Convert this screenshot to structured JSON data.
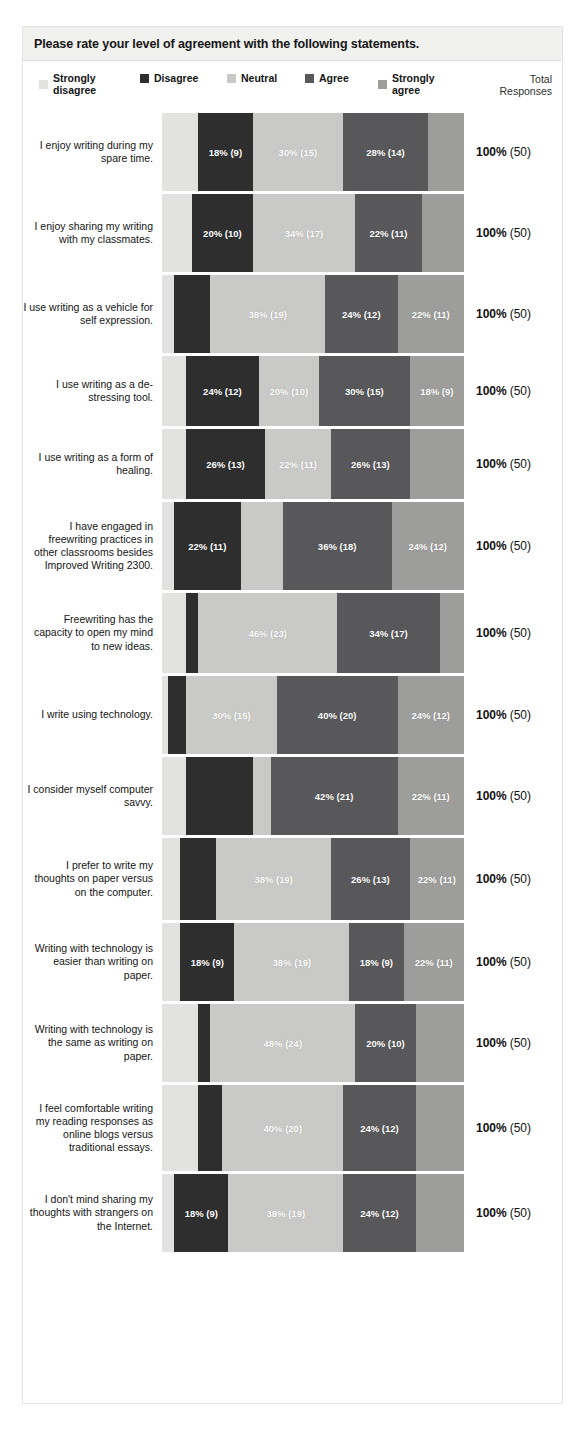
{
  "header": {
    "title": "Please rate your level of agreement with the following statements.",
    "total_header_line1": "Total",
    "total_header_line2": "Responses"
  },
  "legend": {
    "items": [
      {
        "label": "Strongly\ndisagree",
        "key": "strongly_disagree",
        "color": "#e2e2e0"
      },
      {
        "label": "Disagree",
        "key": "disagree",
        "color": "#2e2e2e"
      },
      {
        "label": "Neutral",
        "key": "neutral",
        "color": "#c9c9c7"
      },
      {
        "label": "Agree",
        "key": "agree",
        "color": "#58585a"
      },
      {
        "label": "Strongly\nagree",
        "key": "strongly_agree",
        "color": "#9d9d9b"
      }
    ]
  },
  "chart_data": {
    "type": "bar",
    "subtype": "stacked-horizontal-100pct",
    "title": "Please rate your level of agreement with the following statements.",
    "xlabel": "",
    "ylabel": "",
    "xlim": [
      0,
      100
    ],
    "grid": false,
    "legend_position": "top",
    "value_format": "percent (count)",
    "total_responses": 50,
    "categories": [
      "I enjoy writing during my spare time.",
      "I enjoy sharing my writing with my classmates.",
      "I use writing as a vehicle for self expression.",
      "I use writing as a de-stressing tool.",
      "I use writing as a form of healing.",
      "I have engaged in freewriting practices in other classrooms besides Improved Writing 2300.",
      "Freewriting has the capacity to open my mind to new ideas.",
      "I write using technology.",
      "I consider myself computer savvy.",
      "I prefer to write my thoughts on paper versus on the computer.",
      "Writing with technology is easier than writing on paper.",
      "Writing with technology is the same as writing on paper.",
      "I feel comfortable writing my reading responses as online blogs versus traditional essays.",
      "I don't mind sharing my thoughts with strangers on the Internet."
    ],
    "series": [
      {
        "name": "Strongly disagree",
        "values": [
          12,
          10,
          4,
          8,
          8,
          4,
          8,
          2,
          8,
          6,
          6,
          12,
          12,
          4
        ]
      },
      {
        "name": "Disagree",
        "values": [
          18,
          20,
          12,
          24,
          26,
          22,
          4,
          6,
          22,
          12,
          18,
          4,
          8,
          18
        ]
      },
      {
        "name": "Neutral",
        "values": [
          30,
          34,
          38,
          20,
          22,
          14,
          46,
          30,
          6,
          38,
          38,
          48,
          40,
          38
        ]
      },
      {
        "name": "Agree",
        "values": [
          28,
          22,
          24,
          30,
          26,
          36,
          34,
          40,
          42,
          26,
          18,
          20,
          24,
          24
        ]
      },
      {
        "name": "Strongly agree",
        "values": [
          12,
          14,
          22,
          18,
          18,
          24,
          8,
          22,
          22,
          18,
          20,
          16,
          16,
          16
        ]
      }
    ],
    "counts": [
      {
        "name": "Strongly disagree",
        "values": [
          6,
          5,
          2,
          4,
          4,
          2,
          4,
          1,
          4,
          3,
          3,
          6,
          6,
          2
        ]
      },
      {
        "name": "Disagree",
        "values": [
          9,
          10,
          6,
          12,
          13,
          11,
          2,
          3,
          11,
          6,
          9,
          2,
          4,
          9
        ]
      },
      {
        "name": "Neutral",
        "values": [
          15,
          17,
          19,
          10,
          11,
          7,
          23,
          15,
          3,
          19,
          19,
          24,
          20,
          19
        ]
      },
      {
        "name": "Agree",
        "values": [
          14,
          11,
          12,
          15,
          13,
          18,
          17,
          20,
          21,
          13,
          9,
          10,
          12,
          12
        ]
      },
      {
        "name": "Strongly agree",
        "values": [
          6,
          7,
          11,
          9,
          9,
          12,
          4,
          11,
          11,
          9,
          10,
          8,
          8,
          8
        ]
      }
    ]
  },
  "rows": [
    {
      "label": "I enjoy writing during my spare time.",
      "total": "100%",
      "total_count": "(50)",
      "segments": [
        {
          "key": "strongly_disagree",
          "pct": 12,
          "label": ""
        },
        {
          "key": "disagree",
          "pct": 18,
          "label": "18% (9)"
        },
        {
          "key": "neutral",
          "pct": 30,
          "label": "30% (15)"
        },
        {
          "key": "agree",
          "pct": 28,
          "label": "28% (14)"
        },
        {
          "key": "strongly_agree",
          "pct": 12,
          "label": ""
        }
      ]
    },
    {
      "label": "I enjoy sharing my writing with my classmates.",
      "total": "100%",
      "total_count": "(50)",
      "segments": [
        {
          "key": "strongly_disagree",
          "pct": 10,
          "label": ""
        },
        {
          "key": "disagree",
          "pct": 20,
          "label": "20% (10)"
        },
        {
          "key": "neutral",
          "pct": 34,
          "label": "34% (17)"
        },
        {
          "key": "agree",
          "pct": 22,
          "label": "22% (11)"
        },
        {
          "key": "strongly_agree",
          "pct": 14,
          "label": ""
        }
      ]
    },
    {
      "label": "I use writing as a vehicle for self expression.",
      "total": "100%",
      "total_count": "(50)",
      "segments": [
        {
          "key": "strongly_disagree",
          "pct": 4,
          "label": ""
        },
        {
          "key": "disagree",
          "pct": 12,
          "label": ""
        },
        {
          "key": "neutral",
          "pct": 38,
          "label": "38% (19)"
        },
        {
          "key": "agree",
          "pct": 24,
          "label": "24% (12)"
        },
        {
          "key": "strongly_agree",
          "pct": 22,
          "label": "22% (11)"
        }
      ]
    },
    {
      "label": "I use writing as a de-stressing tool.",
      "total": "100%",
      "total_count": "(50)",
      "segments": [
        {
          "key": "strongly_disagree",
          "pct": 8,
          "label": ""
        },
        {
          "key": "disagree",
          "pct": 24,
          "label": "24% (12)"
        },
        {
          "key": "neutral",
          "pct": 20,
          "label": "20% (10)"
        },
        {
          "key": "agree",
          "pct": 30,
          "label": "30% (15)"
        },
        {
          "key": "strongly_agree",
          "pct": 18,
          "label": "18% (9)"
        }
      ]
    },
    {
      "label": "I use writing as a form of healing.",
      "total": "100%",
      "total_count": "(50)",
      "segments": [
        {
          "key": "strongly_disagree",
          "pct": 8,
          "label": ""
        },
        {
          "key": "disagree",
          "pct": 26,
          "label": "26% (13)"
        },
        {
          "key": "neutral",
          "pct": 22,
          "label": "22% (11)"
        },
        {
          "key": "agree",
          "pct": 26,
          "label": "26% (13)"
        },
        {
          "key": "strongly_agree",
          "pct": 18,
          "label": ""
        }
      ]
    },
    {
      "label": "I have engaged in freewriting practices in other classrooms besides Improved Writing 2300.",
      "total": "100%",
      "total_count": "(50)",
      "segments": [
        {
          "key": "strongly_disagree",
          "pct": 4,
          "label": ""
        },
        {
          "key": "disagree",
          "pct": 22,
          "label": "22% (11)"
        },
        {
          "key": "neutral",
          "pct": 14,
          "label": ""
        },
        {
          "key": "agree",
          "pct": 36,
          "label": "36% (18)"
        },
        {
          "key": "strongly_agree",
          "pct": 24,
          "label": "24% (12)"
        }
      ]
    },
    {
      "label": "Freewriting has the capacity to open my mind to new ideas.",
      "total": "100%",
      "total_count": "(50)",
      "segments": [
        {
          "key": "strongly_disagree",
          "pct": 8,
          "label": ""
        },
        {
          "key": "disagree",
          "pct": 4,
          "label": ""
        },
        {
          "key": "neutral",
          "pct": 46,
          "label": "46% (23)"
        },
        {
          "key": "agree",
          "pct": 34,
          "label": "34% (17)"
        },
        {
          "key": "strongly_agree",
          "pct": 8,
          "label": ""
        }
      ]
    },
    {
      "label": "I write using technology.",
      "total": "100%",
      "total_count": "(50)",
      "segments": [
        {
          "key": "strongly_disagree",
          "pct": 2,
          "label": ""
        },
        {
          "key": "disagree",
          "pct": 6,
          "label": ""
        },
        {
          "key": "neutral",
          "pct": 30,
          "label": "30% (15)"
        },
        {
          "key": "agree",
          "pct": 40,
          "label": "40% (20)"
        },
        {
          "key": "strongly_agree",
          "pct": 22,
          "label": "24% (12)"
        }
      ]
    },
    {
      "label": "I consider myself computer savvy.",
      "total": "100%",
      "total_count": "(50)",
      "segments": [
        {
          "key": "strongly_disagree",
          "pct": 8,
          "label": ""
        },
        {
          "key": "disagree",
          "pct": 22,
          "label": ""
        },
        {
          "key": "neutral",
          "pct": 6,
          "label": ""
        },
        {
          "key": "agree",
          "pct": 42,
          "label": "42% (21)"
        },
        {
          "key": "strongly_agree",
          "pct": 22,
          "label": "22% (11)"
        }
      ]
    },
    {
      "label": "I prefer to write my thoughts on paper versus on the computer.",
      "total": "100%",
      "total_count": "(50)",
      "segments": [
        {
          "key": "strongly_disagree",
          "pct": 6,
          "label": ""
        },
        {
          "key": "disagree",
          "pct": 12,
          "label": ""
        },
        {
          "key": "neutral",
          "pct": 38,
          "label": "38% (19)"
        },
        {
          "key": "agree",
          "pct": 26,
          "label": "26% (13)"
        },
        {
          "key": "strongly_agree",
          "pct": 18,
          "label": "22% (11)"
        }
      ]
    },
    {
      "label": "Writing with technology is easier than writing on paper.",
      "total": "100%",
      "total_count": "(50)",
      "segments": [
        {
          "key": "strongly_disagree",
          "pct": 6,
          "label": ""
        },
        {
          "key": "disagree",
          "pct": 18,
          "label": "18% (9)"
        },
        {
          "key": "neutral",
          "pct": 38,
          "label": "38% (19)"
        },
        {
          "key": "agree",
          "pct": 18,
          "label": "18% (9)"
        },
        {
          "key": "strongly_agree",
          "pct": 20,
          "label": "22% (11)"
        }
      ]
    },
    {
      "label": "Writing with technology is the same as writing on paper.",
      "total": "100%",
      "total_count": "(50)",
      "segments": [
        {
          "key": "strongly_disagree",
          "pct": 12,
          "label": ""
        },
        {
          "key": "disagree",
          "pct": 4,
          "label": ""
        },
        {
          "key": "neutral",
          "pct": 48,
          "label": "48% (24)"
        },
        {
          "key": "agree",
          "pct": 20,
          "label": "20% (10)"
        },
        {
          "key": "strongly_agree",
          "pct": 16,
          "label": ""
        }
      ]
    },
    {
      "label": "I feel comfortable writing my reading responses as online blogs versus traditional essays.",
      "total": "100%",
      "total_count": "(50)",
      "segments": [
        {
          "key": "strongly_disagree",
          "pct": 12,
          "label": ""
        },
        {
          "key": "disagree",
          "pct": 8,
          "label": ""
        },
        {
          "key": "neutral",
          "pct": 40,
          "label": "40% (20)"
        },
        {
          "key": "agree",
          "pct": 24,
          "label": "24% (12)"
        },
        {
          "key": "strongly_agree",
          "pct": 16,
          "label": ""
        }
      ]
    },
    {
      "label": "I don't mind sharing my thoughts with strangers on the Internet.",
      "total": "100%",
      "total_count": "(50)",
      "segments": [
        {
          "key": "strongly_disagree",
          "pct": 4,
          "label": ""
        },
        {
          "key": "disagree",
          "pct": 18,
          "label": "18% (9)"
        },
        {
          "key": "neutral",
          "pct": 38,
          "label": "38% (19)"
        },
        {
          "key": "agree",
          "pct": 24,
          "label": "24% (12)"
        },
        {
          "key": "strongly_agree",
          "pct": 16,
          "label": ""
        }
      ]
    }
  ],
  "row_heights": [
    78,
    78,
    78,
    70,
    70,
    88,
    80,
    78,
    78,
    82,
    78,
    78,
    86,
    78
  ]
}
